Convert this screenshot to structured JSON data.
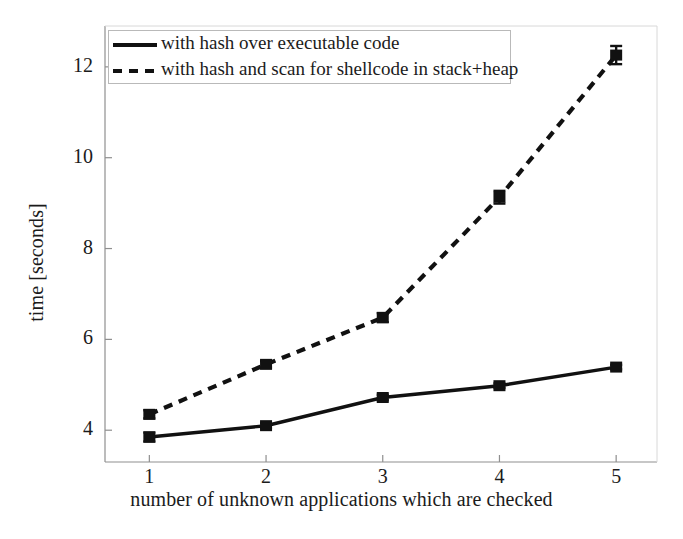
{
  "chart_data": {
    "type": "line",
    "title": "",
    "subtitle": "",
    "xlabel": "number of unknown applications which are checked",
    "ylabel": "time [seconds]",
    "x": [
      1,
      2,
      3,
      4,
      5
    ],
    "xticklabels": [
      "1",
      "2",
      "3",
      "4",
      "5"
    ],
    "yticklabels": [
      "4",
      "6",
      "8",
      "10",
      "12"
    ],
    "yticks": [
      4,
      6,
      8,
      10,
      12
    ],
    "xlim": [
      0.62,
      5.35
    ],
    "ylim": [
      3.3,
      12.9
    ],
    "grid": false,
    "legend_position": "upper left",
    "series": [
      {
        "name": "with hash over executable code",
        "style": "solid",
        "marker": "square",
        "color": "#111111",
        "values": [
          3.85,
          4.1,
          4.72,
          4.98,
          5.39
        ],
        "errors": [
          0.1,
          0.06,
          0.06,
          0.05,
          0.05
        ]
      },
      {
        "name": "with hash and scan for shellcode in stack+heap",
        "style": "dashed",
        "marker": "square",
        "color": "#111111",
        "values": [
          4.35,
          5.45,
          6.48,
          9.13,
          12.26
        ],
        "errors": [
          0.09,
          0.07,
          0.1,
          0.14,
          0.2
        ]
      }
    ]
  },
  "legend": {
    "items": [
      {
        "label": "with hash over executable code",
        "style": "solid"
      },
      {
        "label": "with hash and scan for shellcode in stack+heap",
        "style": "dashed"
      }
    ]
  },
  "axes": {
    "xlabel": "number of unknown applications which are checked",
    "ylabel": "time [seconds]",
    "xticks": [
      "1",
      "2",
      "3",
      "4",
      "5"
    ],
    "yticks": [
      "4",
      "6",
      "8",
      "10",
      "12"
    ]
  }
}
